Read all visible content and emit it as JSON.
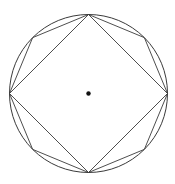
{
  "diagram": {
    "width": 175,
    "height": 184,
    "colors": {
      "stroke": "#3a3a3a",
      "background": "#ffffff",
      "dot": "#111111"
    },
    "circle": {
      "cx": 88.5,
      "cy": 93.5,
      "r": 79
    },
    "center_dot": {
      "r": 2.2
    },
    "inscribed_square": {
      "vertices_angles_deg": [
        90,
        180,
        270,
        0
      ]
    },
    "inscribed_octagon": {
      "vertices_angles_deg": [
        0,
        45,
        90,
        135,
        180,
        225,
        270,
        315
      ]
    }
  }
}
